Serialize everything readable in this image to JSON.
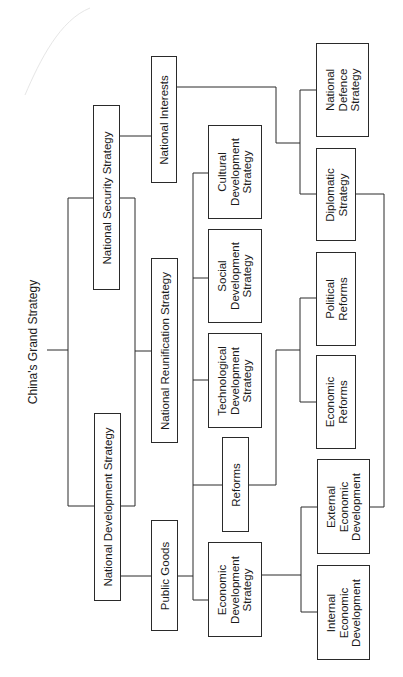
{
  "diagram": {
    "title": "China's Grand Strategy",
    "orientation": "rotated -90deg (tree grows left to right)",
    "nodes": {
      "national_security": "National Security Strategy",
      "national_development": "National Development Strategy",
      "national_interests": "National Interests",
      "national_reunification": "National Reunification Strategy",
      "public_goods": "Public Goods",
      "cultural": "Cultural\nDevelopment\nStrategy",
      "social": "Social\nDevelopment\nStrategy",
      "technological": "Technological\nDevelopment\nStrategy",
      "reforms": "Reforms",
      "economic_development": "Economic\nDevelopment\nStrategy",
      "national_defence": "National\nDefence\nStrategy",
      "diplomatic": "Diplomatic\nStrategy",
      "political_reforms": "Political\nReforms",
      "economic_reforms": "Economic\nReforms",
      "external_economic": "External\nEconomic\nDevelopment",
      "internal_economic": "Internal\nEconomic\nDevelopment"
    },
    "edges": [
      [
        "China's Grand Strategy",
        "National Security Strategy"
      ],
      [
        "China's Grand Strategy",
        "National Development Strategy"
      ],
      [
        "National Security Strategy",
        "National Interests"
      ],
      [
        "National Security Strategy",
        "National Reunification Strategy"
      ],
      [
        "National Development Strategy",
        "National Reunification Strategy"
      ],
      [
        "National Development Strategy",
        "Public Goods"
      ],
      [
        "Public Goods",
        "Cultural Development Strategy"
      ],
      [
        "Public Goods",
        "Social Development Strategy"
      ],
      [
        "Public Goods",
        "Technological Development Strategy"
      ],
      [
        "Public Goods",
        "Reforms"
      ],
      [
        "Public Goods",
        "Economic Development Strategy"
      ],
      [
        "National Interests",
        "National Defence Strategy"
      ],
      [
        "National Interests",
        "Diplomatic Strategy"
      ],
      [
        "Reforms",
        "Political Reforms"
      ],
      [
        "Reforms",
        "Economic Reforms"
      ],
      [
        "Economic Development Strategy",
        "External Economic Development"
      ],
      [
        "Economic Development Strategy",
        "Internal Economic Development"
      ],
      [
        "Diplomatic Strategy",
        "External Economic Development"
      ]
    ]
  }
}
